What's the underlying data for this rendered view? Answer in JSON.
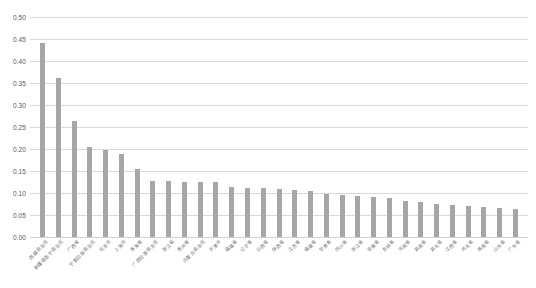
{
  "chart_data": {
    "type": "bar",
    "title": "",
    "subtitle": "",
    "xlabel": "",
    "ylabel": "",
    "ylim": [
      0.0,
      0.5
    ],
    "ytick_labels": [
      "0.50",
      "0.45",
      "0.40",
      "0.35",
      "0.30",
      "0.25",
      "0.20",
      "0.15",
      "0.10",
      "0.05",
      "0.00"
    ],
    "ytick_values": [
      0.5,
      0.45,
      0.4,
      0.35,
      0.3,
      0.25,
      0.2,
      0.15,
      0.1,
      0.05,
      0.0
    ],
    "grid": true,
    "legend": "none",
    "bar_color": "#a6a6a6",
    "gridline_color": "#d9d9d9",
    "axis_text_color": "#595959",
    "categories": [
      "西藏自治区",
      "新疆维吾尔自治区",
      "广西省",
      "宁夏回族自治区",
      "北京市",
      "上海市",
      "青海省",
      "广西壮族自治区",
      "浙江省",
      "贵州省",
      "内蒙古自治区",
      "天津市",
      "福建省",
      "辽宁省",
      "山西省",
      "陕西省",
      "江苏省",
      "福建省",
      "甘肃省",
      "四川省",
      "浙江省",
      "安徽省",
      "吉林省",
      "河南省",
      "湖南省",
      "湖北省",
      "江西省",
      "河北省",
      "海南省",
      "山东省",
      "广东省"
    ],
    "values": [
      0.441,
      0.362,
      0.263,
      0.205,
      0.197,
      0.189,
      0.155,
      0.128,
      0.127,
      0.126,
      0.126,
      0.124,
      0.113,
      0.112,
      0.111,
      0.109,
      0.107,
      0.105,
      0.098,
      0.096,
      0.093,
      0.09,
      0.089,
      0.082,
      0.079,
      0.074,
      0.072,
      0.07,
      0.068,
      0.066,
      0.063
    ]
  }
}
